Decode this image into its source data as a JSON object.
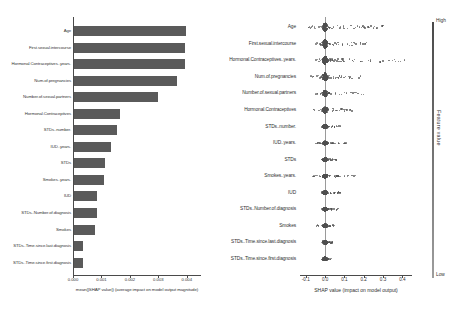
{
  "chart_data": [
    {
      "type": "bar",
      "title": "",
      "orientation": "horizontal",
      "xlabel": "mean(|SHAP value|) (average impact on model output magnitude)",
      "ylabel": "",
      "xlim": [
        0.0,
        0.0045
      ],
      "xticks": [
        "0.000",
        "0.001",
        "0.002",
        "0.003",
        "0.004"
      ],
      "xtick_values": [
        0.0,
        0.001,
        0.002,
        0.003,
        0.004
      ],
      "grid": false,
      "bar_color": "#5a5a5a",
      "categories": [
        "Age",
        "First.sexual.intercourse",
        "Hormonal.Contraceptives..years.",
        "Num.of.pregnancies",
        "Number.of.sexual.partners",
        "Hormonal.Contraceptives",
        "STDs..number.",
        "IUD..years.",
        "STDs",
        "Smokes..years.",
        "IUD",
        "STDs..Number.of.diagnosis",
        "Smokes",
        "STDs..Time.since.last.diagnosis",
        "STDs..Time.since.first.diagnosis"
      ],
      "values": [
        0.00392,
        0.0039,
        0.00389,
        0.00362,
        0.00295,
        0.0016,
        0.00152,
        0.0013,
        0.0011,
        0.00105,
        0.00082,
        0.0008,
        0.00075,
        0.00032,
        0.0003
      ]
    },
    {
      "type": "scatter",
      "subtype": "beeswarm",
      "title": "",
      "xlabel": "SHAP value (impact on model output)",
      "ylabel": "",
      "xlim": [
        -0.13,
        0.45
      ],
      "xticks": [
        "-0.1",
        "0.0",
        "0.1",
        "0.2",
        "0.3",
        "0.4"
      ],
      "xtick_values": [
        -0.1,
        0.0,
        0.1,
        0.2,
        0.3,
        0.4
      ],
      "grid": false,
      "zero_reference_line": 0.0,
      "dot_color": "#4f4f4f",
      "features": [
        "Age",
        "First.sexual.intercourse",
        "Hormonal.Contraceptives..years.",
        "Num.of.pregnancies",
        "Number.of.sexual.partners",
        "Hormonal.Contraceptives",
        "STDs..number.",
        "IUD..years.",
        "STDs",
        "Smokes..years.",
        "IUD",
        "STDs..Number.of.diagnosis",
        "Smokes",
        "STDs..Time.since.last.diagnosis",
        "STDs..Time.since.first.diagnosis"
      ],
      "series": [
        {
          "name": "Age",
          "spread_max": 0.3,
          "spread_min": -0.09,
          "density_width": 7
        },
        {
          "name": "First.sexual.intercourse",
          "spread_max": 0.22,
          "spread_min": -0.06,
          "density_width": 7
        },
        {
          "name": "Hormonal.Contraceptives..years.",
          "spread_max": 0.42,
          "spread_min": -0.05,
          "density_width": 6
        },
        {
          "name": "Num.of.pregnancies",
          "spread_max": 0.19,
          "spread_min": -0.08,
          "density_width": 6
        },
        {
          "name": "Number.of.sexual.partners",
          "spread_max": 0.2,
          "spread_min": -0.05,
          "density_width": 5
        },
        {
          "name": "Hormonal.Contraceptives",
          "spread_max": 0.14,
          "spread_min": -0.06,
          "density_width": 5
        },
        {
          "name": "STDs..number.",
          "spread_max": 0.09,
          "spread_min": -0.02,
          "density_width": 3
        },
        {
          "name": "IUD..years.",
          "spread_max": 0.11,
          "spread_min": -0.06,
          "density_width": 3
        },
        {
          "name": "STDs",
          "spread_max": 0.06,
          "spread_min": -0.02,
          "density_width": 3
        },
        {
          "name": "Smokes..years.",
          "spread_max": 0.16,
          "spread_min": -0.07,
          "density_width": 3
        },
        {
          "name": "IUD",
          "spread_max": 0.08,
          "spread_min": -0.02,
          "density_width": 3
        },
        {
          "name": "STDs..Number.of.diagnosis",
          "spread_max": 0.07,
          "spread_min": -0.02,
          "density_width": 3
        },
        {
          "name": "Smokes",
          "spread_max": 0.05,
          "spread_min": -0.05,
          "density_width": 3
        },
        {
          "name": "STDs..Time.since.last.diagnosis",
          "spread_max": 0.04,
          "spread_min": -0.02,
          "density_width": 3
        },
        {
          "name": "STDs..Time.since.first.diagnosis",
          "spread_max": 0.04,
          "spread_min": -0.02,
          "density_width": 3
        }
      ]
    }
  ],
  "colorbar": {
    "title": "Feature value",
    "high_label": "High",
    "low_label": "Low"
  }
}
